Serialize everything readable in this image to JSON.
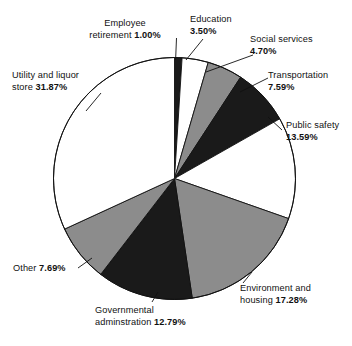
{
  "chart_data": {
    "type": "pie",
    "title": "",
    "start_angle_deg": 0,
    "direction": "clockwise",
    "grid": false,
    "legend": "none",
    "labels_outside": true,
    "unit": "%",
    "categories": [
      "Employee retirement",
      "Education",
      "Social services",
      "Transportation",
      "Public safety",
      "Environment and housing",
      "Governmental adminstration",
      "Other",
      "Utility and liquor store"
    ],
    "values": [
      1.0,
      3.5,
      4.7,
      7.59,
      13.59,
      17.28,
      12.79,
      7.69,
      31.87
    ],
    "value_labels": [
      "1.00%",
      "3.50%",
      "4.70%",
      "7.59%",
      "13.59%",
      "17.28%",
      "12.79%",
      "7.69%",
      "31.87%"
    ],
    "slice_colors": [
      "#1a1a1a",
      "#ffffff",
      "#8c8c8c",
      "#1a1a1a",
      "#ffffff",
      "#8c8c8c",
      "#1a1a1a",
      "#8c8c8c",
      "#ffffff"
    ],
    "stroke_color": "#111111",
    "palette": {
      "black": "#1a1a1a",
      "gray": "#8c8c8c",
      "white": "#ffffff",
      "outline": "#111111",
      "text": "#111111",
      "background": "#ffffff"
    },
    "slices": [
      {
        "name": "Employee retirement",
        "value": 1.0,
        "value_label": "1.00%",
        "color": "#1a1a1a"
      },
      {
        "name": "Education",
        "value": 3.5,
        "value_label": "3.50%",
        "color": "#ffffff"
      },
      {
        "name": "Social services",
        "value": 4.7,
        "value_label": "4.70%",
        "color": "#8c8c8c"
      },
      {
        "name": "Transportation",
        "value": 7.59,
        "value_label": "7.59%",
        "color": "#1a1a1a"
      },
      {
        "name": "Public safety",
        "value": 13.59,
        "value_label": "13.59%",
        "color": "#ffffff"
      },
      {
        "name": "Environment and housing",
        "value": 17.28,
        "value_label": "17.28%",
        "color": "#8c8c8c"
      },
      {
        "name": "Governmental adminstration",
        "value": 12.79,
        "value_label": "12.79%",
        "color": "#1a1a1a"
      },
      {
        "name": "Other",
        "value": 7.69,
        "value_label": "7.69%",
        "color": "#8c8c8c"
      },
      {
        "name": "Utility and liquor store",
        "value": 31.87,
        "value_label": "31.87%",
        "color": "#ffffff"
      }
    ]
  },
  "labels": {
    "employee_retirement": {
      "line1": "Employee",
      "line2": "retirement",
      "value": "1.00%"
    },
    "education": {
      "line1": "Education",
      "value": "3.50%"
    },
    "social_services": {
      "line1": "Social services",
      "value": "4.70%"
    },
    "transportation": {
      "line1": "Transportation",
      "value": "7.59%"
    },
    "public_safety": {
      "line1": "Public safety",
      "value": "13.59%"
    },
    "environment_housing": {
      "line1": "Environment and",
      "line2": "housing",
      "value": "17.28%"
    },
    "governmental_administration": {
      "line1": "Governmental",
      "line2": "adminstration",
      "value": "12.79%"
    },
    "other": {
      "line1": "Other",
      "value": "7.69%"
    },
    "utility_liquor": {
      "line1": "Utility and liquor",
      "line2": "store",
      "value": "31.87%"
    }
  }
}
